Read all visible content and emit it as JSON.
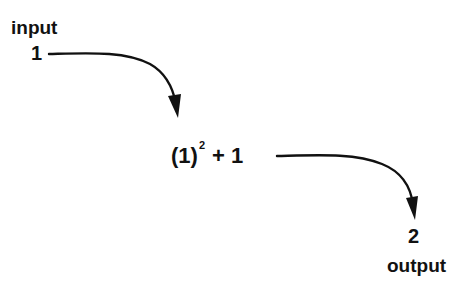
{
  "diagram": {
    "type": "function-evaluation-flow",
    "input": {
      "label": "input",
      "value": "1"
    },
    "expression": {
      "base": "(1)",
      "exponent": "2",
      "rest": "+ 1",
      "full_text": "(1)^2 + 1"
    },
    "output": {
      "value": "2",
      "label": "output"
    },
    "arrows": [
      {
        "from": "input-value",
        "to": "expression",
        "icon": "curved-arrow-down-right-icon"
      },
      {
        "from": "expression",
        "to": "output-value",
        "icon": "curved-arrow-down-right-icon"
      }
    ],
    "colors": {
      "ink": "#111111",
      "background": "#ffffff"
    }
  }
}
